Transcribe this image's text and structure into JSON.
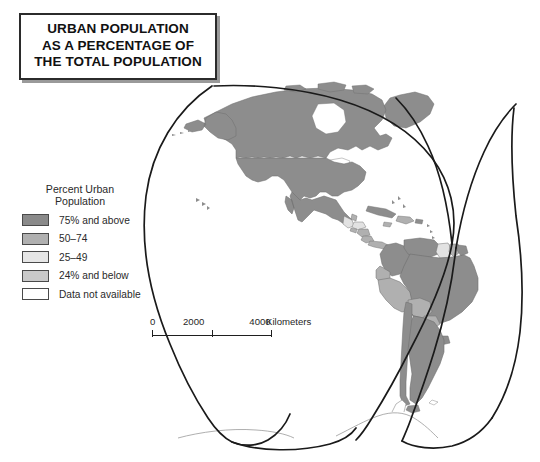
{
  "title": {
    "lines": [
      "URBAN POPULATION",
      "AS A PERCENTAGE OF",
      "THE TOTAL POPULATION"
    ]
  },
  "legend": {
    "heading_line1": "Percent Urban",
    "heading_line2": "Population",
    "items": [
      {
        "label": "75% and above",
        "color": "#8a8a8a"
      },
      {
        "label": "50–74",
        "color": "#b0b0b0"
      },
      {
        "label": "25–49",
        "color": "#e2e2e2"
      },
      {
        "label": "24% and below",
        "color": "#c9c9c9"
      },
      {
        "label": "Data not available",
        "color": "#ffffff"
      }
    ]
  },
  "scalebar": {
    "tick_0": "0",
    "tick_2000": "2000",
    "tick_4000": "4000",
    "unit": "Kilometers"
  },
  "map": {
    "projection": "Goode homolosine interrupted",
    "outline_color": "#1a1a1a",
    "background": "#ffffff",
    "border_color": "#6f6f6f",
    "regions": [
      {
        "name": "Canada",
        "class": "75% and above"
      },
      {
        "name": "United States",
        "class": "75% and above"
      },
      {
        "name": "Greenland",
        "class": "75% and above"
      },
      {
        "name": "Mexico",
        "class": "75% and above"
      },
      {
        "name": "Guatemala",
        "class": "25–49"
      },
      {
        "name": "Belize",
        "class": "50–74"
      },
      {
        "name": "Honduras",
        "class": "25–49"
      },
      {
        "name": "El Salvador",
        "class": "50–74"
      },
      {
        "name": "Nicaragua",
        "class": "50–74"
      },
      {
        "name": "Costa Rica",
        "class": "50–74"
      },
      {
        "name": "Panama",
        "class": "50–74"
      },
      {
        "name": "Cuba",
        "class": "75% and above"
      },
      {
        "name": "Haiti",
        "class": "25–49"
      },
      {
        "name": "Dominican Republic",
        "class": "50–74"
      },
      {
        "name": "Jamaica",
        "class": "50–74"
      },
      {
        "name": "Puerto Rico",
        "class": "75% and above"
      },
      {
        "name": "Colombia",
        "class": "75% and above"
      },
      {
        "name": "Venezuela",
        "class": "75% and above"
      },
      {
        "name": "Guyana",
        "class": "25–49"
      },
      {
        "name": "Suriname",
        "class": "50–74"
      },
      {
        "name": "French Guiana",
        "class": "75% and above"
      },
      {
        "name": "Ecuador",
        "class": "50–74"
      },
      {
        "name": "Peru",
        "class": "50–74"
      },
      {
        "name": "Bolivia",
        "class": "50–74"
      },
      {
        "name": "Brazil",
        "class": "75% and above"
      },
      {
        "name": "Paraguay",
        "class": "50–74"
      },
      {
        "name": "Uruguay",
        "class": "75% and above"
      },
      {
        "name": "Argentina",
        "class": "75% and above"
      },
      {
        "name": "Chile",
        "class": "75% and above"
      },
      {
        "name": "Antarctica",
        "class": "Data not available"
      }
    ]
  }
}
